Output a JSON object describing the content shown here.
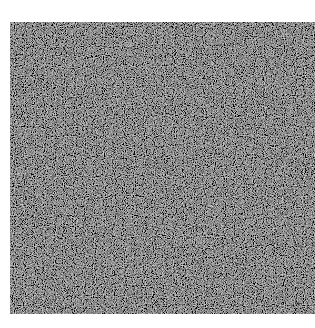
{
  "image": {
    "description": "Grayscale random noise texture",
    "background_color": "#ffffff",
    "noise_base_color": "#1a1a1a",
    "noise_light_color": "#9a9a9a"
  }
}
